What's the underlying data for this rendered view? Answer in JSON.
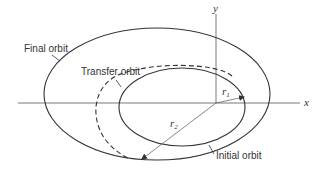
{
  "diagram": {
    "type": "orbit-transfer",
    "labels": {
      "final_orbit": "Final orbit",
      "transfer_orbit": "Transfer orbit",
      "initial_orbit": "Initial orbit",
      "x_axis": "x",
      "y_axis": "y",
      "r1": "r",
      "r1_sub": "1",
      "r2": "r",
      "r2_sub": "2"
    },
    "colors": {
      "line": "#333333",
      "axis": "#555555",
      "background": "#ffffff"
    }
  }
}
